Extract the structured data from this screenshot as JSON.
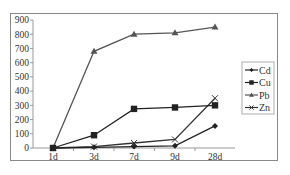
{
  "chart_data": {
    "type": "line",
    "title": "",
    "xlabel": "",
    "ylabel": "",
    "categories": [
      "1d",
      "3d",
      "7d",
      "9d",
      "28d"
    ],
    "ylim": [
      0,
      900
    ],
    "yticks": [
      0,
      100,
      200,
      300,
      400,
      500,
      600,
      700,
      800,
      900
    ],
    "grid": false,
    "legend_position": "right",
    "series": [
      {
        "name": "Cd",
        "marker": "diamond",
        "color": "#222222",
        "values": [
          0,
          5,
          10,
          15,
          155
        ]
      },
      {
        "name": "Cu",
        "marker": "square",
        "color": "#222222",
        "values": [
          0,
          90,
          275,
          285,
          300
        ]
      },
      {
        "name": "Pb",
        "marker": "triangle",
        "color": "#555555",
        "values": [
          0,
          680,
          800,
          810,
          850
        ]
      },
      {
        "name": "Zn",
        "marker": "x",
        "color": "#333333",
        "values": [
          0,
          10,
          35,
          60,
          350
        ]
      }
    ]
  }
}
